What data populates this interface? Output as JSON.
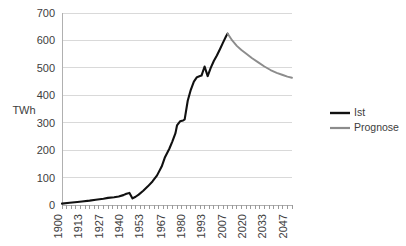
{
  "chart_data": {
    "type": "line",
    "title": "",
    "xlabel": "",
    "ylabel": "TWh",
    "xlim": [
      1900,
      2050
    ],
    "ylim": [
      0,
      700
    ],
    "grid": true,
    "legend_position": "right",
    "y_ticks": [
      0,
      100,
      200,
      300,
      400,
      500,
      600,
      700
    ],
    "x_ticks": [
      1900,
      1913,
      1927,
      1940,
      1953,
      1967,
      1980,
      1993,
      2007,
      2020,
      2033,
      2047
    ],
    "x_minor_tick_step": 3,
    "series": [
      {
        "name": "Ist",
        "color": "#111111",
        "x": [
          1900,
          1905,
          1910,
          1913,
          1918,
          1922,
          1927,
          1930,
          1934,
          1937,
          1940,
          1942,
          1944,
          1946,
          1948,
          1950,
          1953,
          1956,
          1959,
          1962,
          1965,
          1967,
          1970,
          1972,
          1974,
          1975,
          1977,
          1979,
          1980,
          1982,
          1984,
          1986,
          1988,
          1990,
          1991,
          1993,
          1995,
          1997,
          1999,
          2001,
          2003,
          2005,
          2007,
          2008
        ],
        "y": [
          5,
          8,
          11,
          13,
          16,
          19,
          23,
          26,
          28,
          31,
          36,
          41,
          44,
          24,
          30,
          38,
          52,
          68,
          86,
          108,
          140,
          172,
          205,
          232,
          262,
          290,
          305,
          308,
          312,
          380,
          420,
          450,
          466,
          470,
          472,
          505,
          470,
          500,
          525,
          545,
          568,
          592,
          615,
          625
        ]
      },
      {
        "name": "Prognose",
        "color": "#8c8c8c",
        "x": [
          2008,
          2011,
          2014,
          2017,
          2020,
          2024,
          2028,
          2032,
          2036,
          2040,
          2044,
          2047,
          2050
        ],
        "y": [
          625,
          600,
          580,
          565,
          552,
          535,
          520,
          505,
          492,
          482,
          474,
          468,
          464
        ]
      }
    ]
  },
  "legend": {
    "items": [
      {
        "label": "Ist",
        "color": "#111111"
      },
      {
        "label": "Prognose",
        "color": "#8c8c8c"
      }
    ]
  }
}
